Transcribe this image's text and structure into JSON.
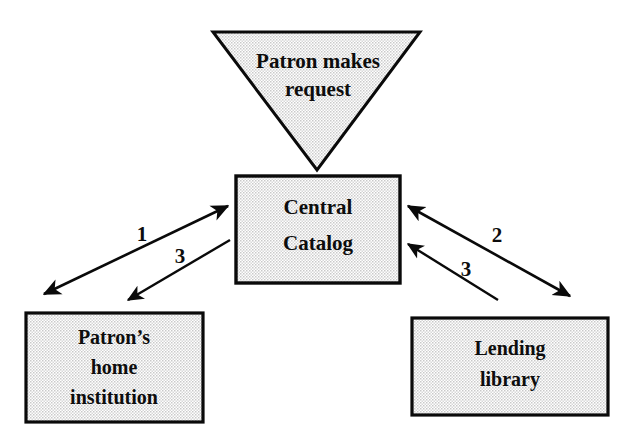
{
  "diagram": {
    "background_color": "#ffffff",
    "line_color": "#0a0a0a",
    "fill_color": "#e6e6e6",
    "text_color": "#0d0d0d",
    "nodes": [
      {
        "id": "patron-request",
        "shape": "triangle-down",
        "lines": [
          "Patron makes",
          "request"
        ],
        "x": 213,
        "y": 32,
        "width": 207,
        "height": 138,
        "font_size": 21
      },
      {
        "id": "central-catalog",
        "shape": "rectangle",
        "lines": [
          "Central",
          "Catalog"
        ],
        "x": 236,
        "y": 176,
        "width": 164,
        "height": 107,
        "font_size": 21
      },
      {
        "id": "patron-home-institution",
        "shape": "rectangle",
        "lines": [
          "Patron’s",
          "home",
          "institution"
        ],
        "x": 26,
        "y": 313,
        "width": 177,
        "height": 109,
        "font_size": 20
      },
      {
        "id": "lending-library",
        "shape": "rectangle",
        "lines": [
          "Lending",
          "library"
        ],
        "x": 412,
        "y": 318,
        "width": 196,
        "height": 97,
        "font_size": 20
      }
    ],
    "connectors": [
      {
        "id": "patron-to-catalog",
        "from": "patron-request",
        "to": "central-catalog",
        "label": "",
        "arrowheads": "none",
        "description": "triangle apex touches top of Central Catalog box"
      },
      {
        "id": "catalog-home-institution-step1",
        "from": "central-catalog",
        "to": "patron-home-institution",
        "label": "1",
        "label_x": 142,
        "label_y": 236,
        "arrowheads": "both",
        "x1": 228,
        "y1": 206,
        "x2": 44,
        "y2": 294
      },
      {
        "id": "catalog-lending-library-step2",
        "from": "central-catalog",
        "to": "lending-library",
        "label": "2",
        "label_x": 497,
        "label_y": 237,
        "arrowheads": "both",
        "x1": 408,
        "y1": 206,
        "x2": 570,
        "y2": 296
      },
      {
        "id": "catalog-to-home-institution-step3",
        "from": "central-catalog",
        "to": "patron-home-institution",
        "label": "3",
        "label_x": 180,
        "label_y": 258,
        "arrowheads": "end",
        "x1": 230,
        "y1": 240,
        "x2": 128,
        "y2": 300
      },
      {
        "id": "lending-library-to-catalog-step3",
        "from": "lending-library",
        "to": "central-catalog",
        "label": "3",
        "label_x": 466,
        "label_y": 271,
        "arrowheads": "end",
        "x1": 498,
        "y1": 300,
        "x2": 408,
        "y2": 244
      }
    ]
  }
}
